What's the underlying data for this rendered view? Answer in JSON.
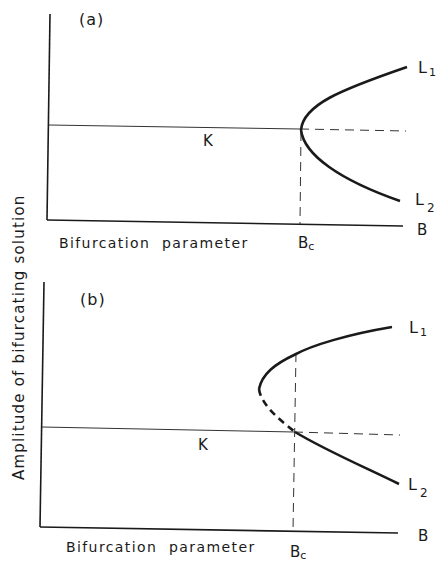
{
  "figure": {
    "y_axis_label": "Amplitude of bifurcating solution",
    "panels": [
      {
        "id": "a",
        "label": "(a)",
        "x_axis_label": "Bifurcation parameter",
        "critical_label": "Bc",
        "critical_base": "B",
        "critical_sub": "c",
        "axis_end_label": "B",
        "trivial_branch_label": "K",
        "branches": [
          {
            "name": "L1",
            "base": "L",
            "sub": "1",
            "style": "solid"
          },
          {
            "name": "L2",
            "base": "L",
            "sub": "2",
            "style": "solid"
          }
        ],
        "type": "supercritical pitchfork"
      },
      {
        "id": "b",
        "label": "(b)",
        "x_axis_label": "Bifurcation parameter",
        "critical_label": "Bc",
        "critical_base": "B",
        "critical_sub": "c",
        "axis_end_label": "B",
        "trivial_branch_label": "K",
        "branches": [
          {
            "name": "L1",
            "base": "L",
            "sub": "1",
            "style": "solid with dashed unstable segment"
          },
          {
            "name": "L2",
            "base": "L",
            "sub": "2",
            "style": "solid"
          }
        ],
        "type": "transcritical / subcritical with turning point"
      }
    ],
    "colors": {
      "ink": "#1a1a1a",
      "background": "#ffffff"
    }
  }
}
